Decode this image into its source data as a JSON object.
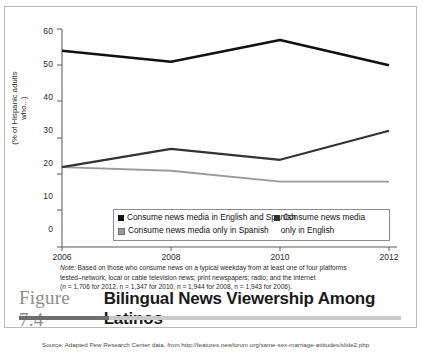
{
  "figure": {
    "number": "Figure 7.4",
    "title": "Bilingual News Viewership Among Latinos"
  },
  "note": {
    "label": "Note:",
    "line1": " Based on those who consume news on a typical weekday from at least one of four platforms",
    "line2": "tested–network, local or cable television news; print newspapers; radio; and the internet",
    "line3": "(n = 1,706 for 2012, n = 1,347 for 2010, n = 1,944 for 2008, n = 1,943 for 2006)."
  },
  "source": "Source: Adapted Pew Research Center data, from http://features.newforum.org/same-sex-marriage-attitudes/slide2.php",
  "legend": {
    "entry1": "Consume news media in English and Spanish",
    "entry2_line1": "Consume news media",
    "entry2_line2": "only in English",
    "entry3": "Consume news media only in Spanish"
  },
  "chart_data": {
    "type": "line",
    "title": "Bilingual News Viewership Among Latinos",
    "xlabel": "",
    "ylabel": "(% of Hispanic adults who...)",
    "categories": [
      "2006",
      "2008",
      "2010",
      "2012"
    ],
    "x_ticks": [
      "2006",
      "2008",
      "2010",
      "2012"
    ],
    "y_ticks": [
      "0",
      "10",
      "20",
      "30",
      "40",
      "50",
      "60"
    ],
    "ylim": [
      0,
      60
    ],
    "grid": false,
    "legend_position": "bottom",
    "series": [
      {
        "name": "Consume news media in English and Spanish",
        "color": "#111111",
        "values": [
          54,
          51,
          57,
          50
        ]
      },
      {
        "name": "Consume news media only in English",
        "color": "#333333",
        "values": [
          22,
          27,
          24,
          32
        ]
      },
      {
        "name": "Consume news media only in Spanish",
        "color": "#9a9a9a",
        "values": [
          22,
          21,
          18,
          18
        ]
      }
    ]
  }
}
